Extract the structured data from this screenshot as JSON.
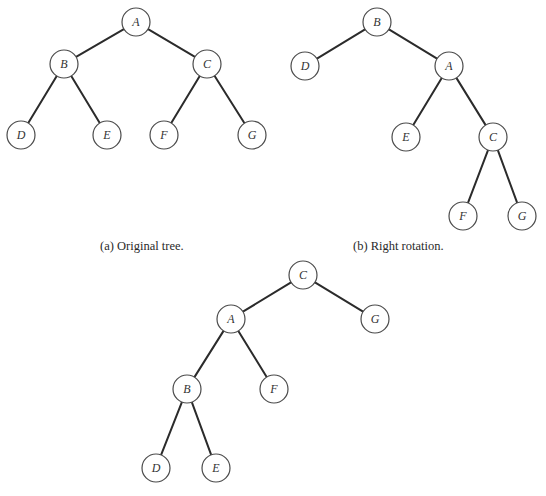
{
  "figure": {
    "radius": 14,
    "colors": {
      "edge": "#2b2b2b",
      "node_stroke": "#4a4a4a",
      "node_fill": "#ffffff",
      "text": "#333333",
      "background": "#ffffff"
    },
    "trees": [
      {
        "id": "a",
        "caption": "(a) Original tree.",
        "caption_pos": {
          "x": 100,
          "y": 240
        },
        "nodes": [
          {
            "id": "A",
            "label": "A",
            "x": 136,
            "y": 22
          },
          {
            "id": "B",
            "label": "B",
            "x": 64,
            "y": 64
          },
          {
            "id": "C",
            "label": "C",
            "x": 207,
            "y": 64
          },
          {
            "id": "D",
            "label": "D",
            "x": 21,
            "y": 135
          },
          {
            "id": "E",
            "label": "E",
            "x": 107,
            "y": 135
          },
          {
            "id": "F",
            "label": "F",
            "x": 164,
            "y": 135
          },
          {
            "id": "G",
            "label": "G",
            "x": 252,
            "y": 135
          }
        ],
        "edges": [
          [
            "A",
            "B"
          ],
          [
            "A",
            "C"
          ],
          [
            "B",
            "D"
          ],
          [
            "B",
            "E"
          ],
          [
            "C",
            "F"
          ],
          [
            "C",
            "G"
          ]
        ]
      },
      {
        "id": "b",
        "caption": "(b) Right rotation.",
        "caption_pos": {
          "x": 353,
          "y": 240
        },
        "nodes": [
          {
            "id": "B",
            "label": "B",
            "x": 377,
            "y": 22
          },
          {
            "id": "D",
            "label": "D",
            "x": 305,
            "y": 66
          },
          {
            "id": "A",
            "label": "A",
            "x": 449,
            "y": 66
          },
          {
            "id": "E",
            "label": "E",
            "x": 406,
            "y": 137
          },
          {
            "id": "C",
            "label": "C",
            "x": 493,
            "y": 137
          },
          {
            "id": "F",
            "label": "F",
            "x": 463,
            "y": 216
          },
          {
            "id": "G",
            "label": "G",
            "x": 522,
            "y": 216
          }
        ],
        "edges": [
          [
            "B",
            "D"
          ],
          [
            "B",
            "A"
          ],
          [
            "A",
            "E"
          ],
          [
            "A",
            "C"
          ],
          [
            "C",
            "F"
          ],
          [
            "C",
            "G"
          ]
        ]
      },
      {
        "id": "c",
        "caption": "",
        "caption_pos": {
          "x": 228,
          "y": 492
        },
        "nodes": [
          {
            "id": "C",
            "label": "C",
            "x": 303,
            "y": 275
          },
          {
            "id": "A",
            "label": "A",
            "x": 231,
            "y": 319
          },
          {
            "id": "G",
            "label": "G",
            "x": 375,
            "y": 319
          },
          {
            "id": "B",
            "label": "B",
            "x": 187,
            "y": 389
          },
          {
            "id": "F",
            "label": "F",
            "x": 274,
            "y": 389
          },
          {
            "id": "D",
            "label": "D",
            "x": 156,
            "y": 468
          },
          {
            "id": "E",
            "label": "E",
            "x": 216,
            "y": 468
          }
        ],
        "edges": [
          [
            "C",
            "A"
          ],
          [
            "C",
            "G"
          ],
          [
            "A",
            "B"
          ],
          [
            "A",
            "F"
          ],
          [
            "B",
            "D"
          ],
          [
            "B",
            "E"
          ]
        ]
      }
    ]
  }
}
